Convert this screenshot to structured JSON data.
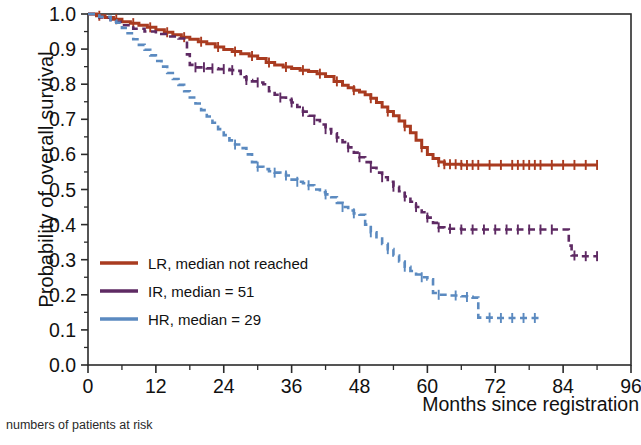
{
  "chart_data": {
    "type": "line",
    "title": "",
    "subtitle": "",
    "xlabel": "Months since registration",
    "ylabel": "Probability of overall survival",
    "caption": "numbers of patients at risk",
    "xlim": [
      0,
      96
    ],
    "ylim": [
      0,
      1
    ],
    "xticks": [
      0,
      12,
      24,
      36,
      48,
      60,
      72,
      84,
      96
    ],
    "xtick_labels": [
      "0",
      "12",
      "24",
      "36",
      "48",
      "60",
      "72",
      "84",
      "96"
    ],
    "xminor_step": 6,
    "yticks": [
      0.0,
      0.1,
      0.2,
      0.3,
      0.4,
      0.5,
      0.6,
      0.7,
      0.8,
      0.9,
      1.0
    ],
    "ytick_labels": [
      "0.0",
      "0.1",
      "0.2",
      "0.3",
      "0.4",
      "0.5",
      "0.6",
      "0.7",
      "0.8",
      "0.9",
      "1.0"
    ],
    "grid": false,
    "frame": true,
    "legend_position": "lower-left-inside",
    "series": [
      {
        "name": "LR",
        "label": "LR, median not reached",
        "median": "not reached",
        "color": "#A93B20",
        "dash": "solid",
        "points": [
          [
            0,
            1.0
          ],
          [
            1.5,
            0.995
          ],
          [
            3,
            0.99
          ],
          [
            4.5,
            0.985
          ],
          [
            6,
            0.978
          ],
          [
            7.5,
            0.974
          ],
          [
            9,
            0.968
          ],
          [
            10.5,
            0.962
          ],
          [
            12,
            0.955
          ],
          [
            13.5,
            0.948
          ],
          [
            15,
            0.941
          ],
          [
            16.5,
            0.934
          ],
          [
            18,
            0.928
          ],
          [
            19.5,
            0.921
          ],
          [
            21,
            0.915
          ],
          [
            22.5,
            0.906
          ],
          [
            24,
            0.899
          ],
          [
            25.5,
            0.893
          ],
          [
            27,
            0.887
          ],
          [
            28.5,
            0.88
          ],
          [
            30,
            0.873
          ],
          [
            31.5,
            0.862
          ],
          [
            33,
            0.855
          ],
          [
            34.5,
            0.849
          ],
          [
            36,
            0.845
          ],
          [
            37.5,
            0.84
          ],
          [
            39,
            0.836
          ],
          [
            40.5,
            0.83
          ],
          [
            42,
            0.822
          ],
          [
            43.5,
            0.808
          ],
          [
            45,
            0.797
          ],
          [
            46,
            0.79
          ],
          [
            47,
            0.783
          ],
          [
            48,
            0.778
          ],
          [
            49,
            0.77
          ],
          [
            50,
            0.76
          ],
          [
            51,
            0.748
          ],
          [
            52,
            0.735
          ],
          [
            53,
            0.722
          ],
          [
            54,
            0.71
          ],
          [
            55,
            0.695
          ],
          [
            56,
            0.68
          ],
          [
            57,
            0.662
          ],
          [
            58,
            0.64
          ],
          [
            59,
            0.62
          ],
          [
            60,
            0.6
          ],
          [
            61,
            0.588
          ],
          [
            62,
            0.578
          ],
          [
            63,
            0.572
          ],
          [
            66,
            0.57
          ],
          [
            70,
            0.57
          ],
          [
            75,
            0.57
          ],
          [
            80,
            0.57
          ],
          [
            85,
            0.57
          ],
          [
            90,
            0.57
          ]
        ],
        "censor_marks": [
          2,
          5,
          8,
          11,
          14,
          17,
          20,
          23,
          26,
          29,
          32,
          35,
          38,
          41,
          44,
          47,
          50,
          53,
          56,
          59,
          62,
          63,
          64,
          65,
          66,
          67,
          68,
          69,
          71,
          73,
          75,
          76,
          77,
          78,
          79,
          80,
          82,
          84,
          86,
          88,
          90
        ],
        "plateau_value": 0.57,
        "end_x": 90
      },
      {
        "name": "IR",
        "label": "IR, median = 51",
        "median": 51,
        "color": "#5E2A63",
        "dash": "dashed",
        "points": [
          [
            0,
            1.0
          ],
          [
            2,
            0.99
          ],
          [
            4,
            0.978
          ],
          [
            6,
            0.968
          ],
          [
            8,
            0.958
          ],
          [
            10,
            0.95
          ],
          [
            12,
            0.943
          ],
          [
            14,
            0.936
          ],
          [
            16,
            0.93
          ],
          [
            17,
            0.925
          ],
          [
            17.5,
            0.885
          ],
          [
            18,
            0.855
          ],
          [
            19,
            0.848
          ],
          [
            21,
            0.845
          ],
          [
            23,
            0.843
          ],
          [
            25,
            0.84
          ],
          [
            26,
            0.838
          ],
          [
            27,
            0.82
          ],
          [
            28,
            0.812
          ],
          [
            29,
            0.808
          ],
          [
            30,
            0.805
          ],
          [
            31,
            0.8
          ],
          [
            32,
            0.78
          ],
          [
            33,
            0.77
          ],
          [
            34,
            0.762
          ],
          [
            35,
            0.755
          ],
          [
            36,
            0.748
          ],
          [
            37,
            0.735
          ],
          [
            38,
            0.722
          ],
          [
            39,
            0.71
          ],
          [
            40,
            0.698
          ],
          [
            41,
            0.685
          ],
          [
            42,
            0.672
          ],
          [
            43,
            0.66
          ],
          [
            44,
            0.648
          ],
          [
            45,
            0.635
          ],
          [
            46,
            0.62
          ],
          [
            47,
            0.605
          ],
          [
            48,
            0.592
          ],
          [
            49,
            0.578
          ],
          [
            50,
            0.562
          ],
          [
            51,
            0.548
          ],
          [
            52,
            0.535
          ],
          [
            53,
            0.522
          ],
          [
            54,
            0.508
          ],
          [
            55,
            0.495
          ],
          [
            56,
            0.48
          ],
          [
            57,
            0.465
          ],
          [
            58,
            0.45
          ],
          [
            59,
            0.435
          ],
          [
            60,
            0.42
          ],
          [
            61,
            0.405
          ],
          [
            62,
            0.392
          ],
          [
            63,
            0.388
          ],
          [
            66,
            0.386
          ],
          [
            70,
            0.386
          ],
          [
            75,
            0.386
          ],
          [
            80,
            0.386
          ],
          [
            84,
            0.386
          ],
          [
            85,
            0.34
          ],
          [
            85.5,
            0.312
          ],
          [
            87,
            0.31
          ],
          [
            90,
            0.31
          ]
        ],
        "censor_marks": [
          19,
          20.5,
          22,
          24,
          25.5,
          28,
          30,
          34,
          36,
          38,
          40,
          42,
          44,
          46,
          48,
          50,
          52,
          54,
          56,
          58,
          60,
          62,
          64,
          66,
          68,
          70,
          72,
          74,
          76,
          78,
          80,
          82,
          86,
          88,
          90
        ],
        "plateau_value": 0.386,
        "final_value": 0.31,
        "end_x": 90
      },
      {
        "name": "HR",
        "label": "HR, median = 29",
        "median": 29,
        "color": "#5B8AC0",
        "dash": "dashed",
        "points": [
          [
            0,
            1.0
          ],
          [
            2,
            0.992
          ],
          [
            4,
            0.982
          ],
          [
            5,
            0.975
          ],
          [
            6,
            0.96
          ],
          [
            7,
            0.945
          ],
          [
            8,
            0.928
          ],
          [
            9,
            0.912
          ],
          [
            10,
            0.898
          ],
          [
            11,
            0.882
          ],
          [
            12,
            0.866
          ],
          [
            13,
            0.85
          ],
          [
            14,
            0.832
          ],
          [
            15,
            0.815
          ],
          [
            16,
            0.798
          ],
          [
            17,
            0.78
          ],
          [
            18,
            0.762
          ],
          [
            19,
            0.745
          ],
          [
            20,
            0.726
          ],
          [
            21,
            0.708
          ],
          [
            22,
            0.69
          ],
          [
            23,
            0.672
          ],
          [
            24,
            0.655
          ],
          [
            25,
            0.64
          ],
          [
            26,
            0.628
          ],
          [
            27,
            0.618
          ],
          [
            28,
            0.6
          ],
          [
            29,
            0.578
          ],
          [
            30,
            0.565
          ],
          [
            31,
            0.558
          ],
          [
            32,
            0.552
          ],
          [
            33,
            0.548
          ],
          [
            34,
            0.545
          ],
          [
            35,
            0.54
          ],
          [
            36,
            0.528
          ],
          [
            37,
            0.522
          ],
          [
            38,
            0.518
          ],
          [
            39,
            0.512
          ],
          [
            40,
            0.5
          ],
          [
            41,
            0.492
          ],
          [
            42,
            0.486
          ],
          [
            43,
            0.478
          ],
          [
            44,
            0.462
          ],
          [
            45,
            0.45
          ],
          [
            46,
            0.44
          ],
          [
            47,
            0.432
          ],
          [
            48,
            0.428
          ],
          [
            49,
            0.4
          ],
          [
            50,
            0.378
          ],
          [
            51,
            0.36
          ],
          [
            52,
            0.345
          ],
          [
            53,
            0.33
          ],
          [
            54,
            0.312
          ],
          [
            55,
            0.295
          ],
          [
            56,
            0.28
          ],
          [
            57,
            0.268
          ],
          [
            58,
            0.258
          ],
          [
            59,
            0.25
          ],
          [
            60,
            0.244
          ],
          [
            61,
            0.205
          ],
          [
            62,
            0.2
          ],
          [
            64,
            0.198
          ],
          [
            66,
            0.196
          ],
          [
            67,
            0.194
          ],
          [
            68,
            0.192
          ],
          [
            69,
            0.135
          ],
          [
            72,
            0.134
          ],
          [
            76,
            0.134
          ],
          [
            80,
            0.134
          ]
        ],
        "censor_marks": [
          26,
          30,
          33,
          35,
          37,
          39,
          42,
          45,
          47,
          50,
          53,
          56,
          59,
          62,
          65,
          67,
          71,
          73,
          75,
          77,
          79
        ],
        "plateau_value": 0.134,
        "end_x": 80
      }
    ]
  },
  "legend": {
    "entries": [
      {
        "label": "LR, median not reached",
        "color": "#A93B20"
      },
      {
        "label": "IR, median = 51",
        "color": "#5E2A63"
      },
      {
        "label": "HR, median = 29",
        "color": "#5B8AC0"
      }
    ]
  },
  "axes": {
    "x_title": "Months since registration",
    "y_title": "Probability of overall survival"
  },
  "footer": {
    "risk_table_caption": "numbers of patients at risk"
  }
}
